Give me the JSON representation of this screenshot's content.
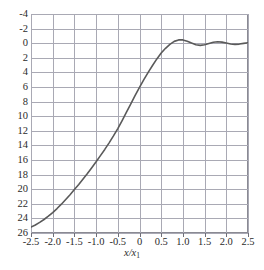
{
  "chart_data": {
    "type": "line",
    "title": "",
    "subtitle": "",
    "xlabel": "x/x",
    "xlabel_sub": "1",
    "ylabel": "",
    "xlim": [
      -2.5,
      2.5
    ],
    "ylim": [
      -4,
      26
    ],
    "y_axis_inverted": true,
    "grid": true,
    "legend": null,
    "xticks": [
      "-2.5",
      "-2.0",
      "-1.5",
      "-1.0",
      "-0.5",
      "0",
      "0.5",
      "1.0",
      "1.5",
      "2.0",
      "2.5"
    ],
    "xtick_values": [
      -2.5,
      -2.0,
      -1.5,
      -1.0,
      -0.5,
      0,
      0.5,
      1.0,
      1.5,
      2.0,
      2.5
    ],
    "yticks": [
      "-4",
      "-2",
      "0",
      "2",
      "4",
      "6",
      "8",
      "10",
      "12",
      "14",
      "16",
      "18",
      "20",
      "22",
      "24",
      "26"
    ],
    "ytick_values": [
      -4,
      -2,
      0,
      2,
      4,
      6,
      8,
      10,
      12,
      14,
      16,
      18,
      20,
      22,
      24,
      26
    ],
    "line_color": "#5a5a5a",
    "grid_color": "#a9a9b4",
    "frame_color": "#8a8a93",
    "series": [
      {
        "name": "curve",
        "x": [
          -2.5,
          -2.4,
          -2.3,
          -2.2,
          -2.1,
          -2.0,
          -1.9,
          -1.8,
          -1.7,
          -1.6,
          -1.5,
          -1.4,
          -1.3,
          -1.2,
          -1.1,
          -1.0,
          -0.9,
          -0.8,
          -0.7,
          -0.6,
          -0.5,
          -0.4,
          -0.3,
          -0.2,
          -0.1,
          0.0,
          0.1,
          0.2,
          0.3,
          0.4,
          0.5,
          0.6,
          0.7,
          0.8,
          0.9,
          1.0,
          1.1,
          1.2,
          1.3,
          1.4,
          1.5,
          1.6,
          1.7,
          1.8,
          1.9,
          2.0,
          2.1,
          2.2,
          2.3,
          2.4,
          2.5
        ],
        "y": [
          25.2,
          24.9,
          24.55,
          24.15,
          23.7,
          23.2,
          22.65,
          22.05,
          21.4,
          20.75,
          20.05,
          19.35,
          18.6,
          17.85,
          17.05,
          16.25,
          15.4,
          14.55,
          13.65,
          12.7,
          11.7,
          10.6,
          9.45,
          8.3,
          7.15,
          6.05,
          5.0,
          4.0,
          3.05,
          2.15,
          1.35,
          0.7,
          0.15,
          -0.25,
          -0.45,
          -0.45,
          -0.28,
          -0.02,
          0.22,
          0.3,
          0.22,
          0.04,
          -0.12,
          -0.2,
          -0.15,
          -0.02,
          0.1,
          0.16,
          0.12,
          0.02,
          -0.06
        ]
      }
    ],
    "annotations": []
  }
}
